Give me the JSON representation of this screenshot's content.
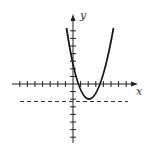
{
  "diagram": {
    "type": "function-graph",
    "axes": {
      "x_label": "x",
      "y_label": "y",
      "tick_count_x_negative": 7,
      "tick_count_x_positive": 7,
      "tick_count_y_positive": 7,
      "tick_count_y_negative": 7,
      "tick_spacing_units": 1
    },
    "curve": {
      "kind": "parabola",
      "opens": "up",
      "approx_vertex": [
        2,
        -2
      ],
      "approx_x_intercepts": [
        0.6,
        3.4
      ],
      "approx_y_intercept": 2.5
    },
    "dashed_line": {
      "kind": "horizontal",
      "approx_y": -2.2
    },
    "colors": {
      "stroke": "#222222",
      "background": "#ffffff"
    }
  }
}
